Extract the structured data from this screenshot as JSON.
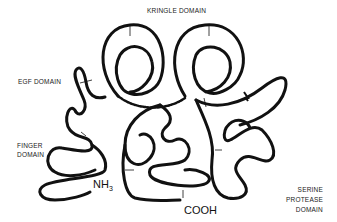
{
  "diagram": {
    "type": "protein-domain-schematic",
    "labels": {
      "kringle": "KRINGLE DOMAIN",
      "egf": "EGF DOMAIN",
      "finger_line1": "FINGER",
      "finger_line2": "DOMAIN",
      "serine_line1": "SERINE",
      "serine_line2": "PROTEASE",
      "serine_line3": "DOMAIN",
      "n_terminus": "NH",
      "n_terminus_sub": "3",
      "c_terminus": "COOH"
    },
    "colors": {
      "chain": "#111111",
      "background": "#ffffff"
    }
  }
}
